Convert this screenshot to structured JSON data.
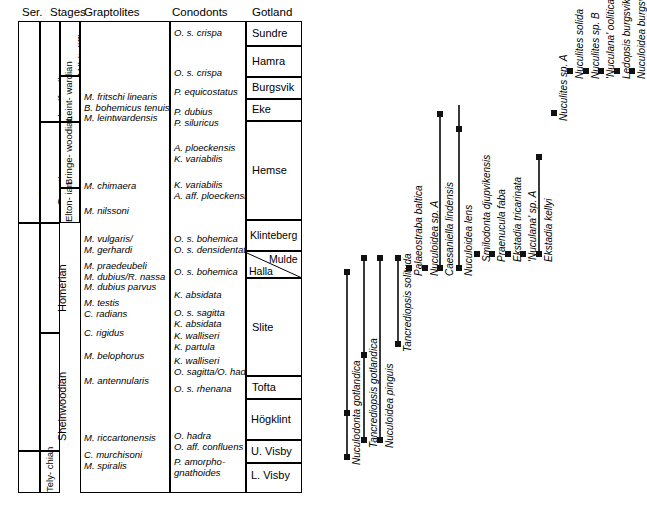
{
  "table": {
    "headers": [
      "Ser.",
      "Stages",
      "Graptolites",
      "Conodonts",
      "Gotland"
    ],
    "series": [
      {
        "label": "Ludlow"
      },
      {
        "label": "Wenlock"
      },
      {
        "label": "Ll."
      }
    ],
    "stages_outer": [
      {
        "label": "Ludfordian"
      },
      {
        "label": "Gorstian"
      },
      {
        "label": "Homerian"
      },
      {
        "label": "Sheinwoodian"
      },
      {
        "label": "Tely-\nchian"
      }
    ],
    "stages_inner": [
      {
        "label": "Whitcliffian"
      },
      {
        "label": "Leint-\nwardian"
      },
      {
        "label": "Bringe-\nwoodian"
      },
      {
        "label": "Elton-\nian"
      }
    ],
    "graptolites": [
      "M. fritschi linearis\nB. bohemicus tenuis\nM. leintwardensis",
      "M. chimaera",
      "M. nilssoni",
      "M. vulgaris/\nM. gerhardi",
      "M. praedeubeli\nM. dubius/R. nassa\nM. dubius parvus",
      "M. testis\nC. radians",
      "C. rigidus",
      "M. belophorus",
      "M. antennularis",
      "M. riccartonensis",
      "C. murchisoni\nM. spiralis"
    ],
    "conodonts": [
      "O. s. crispa",
      "O. s. crispa",
      "P. equicostatus",
      "P. dubius\nP. siluricus",
      "A. ploeckensis\nK. variabilis",
      "K. variabilis\nA. aff. ploeckensis",
      "O. s. bohemica\nO. s. densidentata",
      "O. s. bohemica",
      "K. absidata",
      "O. s. sagitta\nK. absidata",
      "K. walliseri\nK. partula",
      "K. walliseri\nO. sagitta/O. hadra",
      "O. s. rhenana",
      "O. hadra\nO. aff. confluens",
      "P. amorpho-\ngnathoides"
    ],
    "gotland": [
      "Sundre",
      "Hamra",
      "Burgsvik",
      "Eke",
      "Hemse",
      "Klinteberg",
      "Mulde",
      "Halla",
      "Slite",
      "Tofta",
      "Högklint",
      "U. Visby",
      "L. Visby"
    ]
  },
  "chart_data": {
    "type": "range",
    "title": "",
    "xlabel": "",
    "ylabel": "",
    "taxa": [
      {
        "name": "Nuculodonta gotlandica",
        "x": 347,
        "top": 272,
        "bottom": 457,
        "markers": [
          272,
          413,
          457
        ]
      },
      {
        "name": "Tancrediopsis gotlandica",
        "x": 364,
        "top": 258,
        "bottom": 440,
        "markers": [
          258,
          355,
          440
        ]
      },
      {
        "name": "Nuculoidea pinguis",
        "x": 380,
        "top": 258,
        "bottom": 440,
        "markers": [
          258,
          440
        ]
      },
      {
        "name": "Tancrediopsis solituda",
        "x": 398,
        "top": 258,
        "bottom": 344,
        "markers": [
          258,
          344
        ]
      },
      {
        "name": "Palaeostraba baltica",
        "x": 409,
        "top": 268,
        "bottom": 268,
        "markers": [
          268
        ]
      },
      {
        "name": "Nuculoidea sp. A",
        "x": 425,
        "top": 268,
        "bottom": 268,
        "markers": [
          268
        ]
      },
      {
        "name": "Caesaniella lindensis",
        "x": 440,
        "top": 114,
        "bottom": 268,
        "markers": [
          114,
          268
        ]
      },
      {
        "name": "Nuculoidea lens",
        "x": 459,
        "top": 105,
        "bottom": 268,
        "markers": [
          129,
          268
        ]
      },
      {
        "name": "Smilodonta djupvikensis",
        "x": 477,
        "top": 254,
        "bottom": 254,
        "markers": [
          254
        ]
      },
      {
        "name": "Praenucula faba",
        "x": 492,
        "top": 254,
        "bottom": 254,
        "markers": [
          254
        ]
      },
      {
        "name": "Ekstadia tricarinata",
        "x": 508,
        "top": 254,
        "bottom": 254,
        "markers": [
          254
        ]
      },
      {
        "name": "'Nuculana' sp. A",
        "x": 523,
        "top": 254,
        "bottom": 254,
        "markers": [
          254
        ]
      },
      {
        "name": "Ekstadia kellyi",
        "x": 539,
        "top": 157,
        "bottom": 254,
        "markers": [
          157,
          254
        ]
      },
      {
        "name": "Nuculites sp. A",
        "x": 554,
        "top": 113,
        "bottom": 113,
        "markers": [
          113
        ]
      },
      {
        "name": "Nuculites solida",
        "x": 570,
        "top": 71,
        "bottom": 71,
        "markers": [
          71
        ]
      },
      {
        "name": "Nuculites sp. B",
        "x": 586,
        "top": 71,
        "bottom": 71,
        "markers": [
          71
        ]
      },
      {
        "name": "'Nuculana' oolitica",
        "x": 601,
        "top": 71,
        "bottom": 71,
        "markers": [
          71
        ]
      },
      {
        "name": "Ledopsis burgsvikensis",
        "x": 617,
        "top": 71,
        "bottom": 71,
        "markers": [
          71
        ]
      },
      {
        "name": "Nuculoidea burgsvikensis",
        "x": 632,
        "top": 71,
        "bottom": 71,
        "markers": [
          71
        ]
      }
    ]
  }
}
